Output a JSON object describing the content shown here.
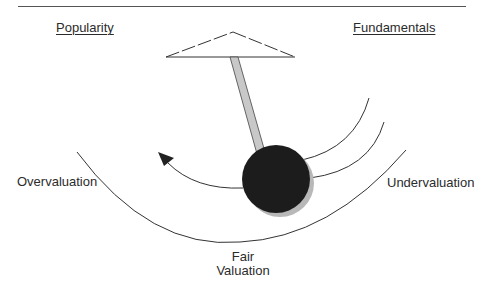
{
  "diagram": {
    "title_fragment": "",
    "labels": {
      "popularity": "Popularity",
      "fundamentals": "Fundamentals",
      "overvaluation": "Overvaluation",
      "undervaluation": "Undervaluation",
      "fair_line1": "Fair",
      "fair_line2": "Valuation"
    },
    "colors": {
      "ink": "#2b2b2b",
      "bob": "#1c1c1c",
      "bob_shadow": "#b8b8b8",
      "rod_fill": "#c8c8c8",
      "rule": "#555555"
    }
  }
}
